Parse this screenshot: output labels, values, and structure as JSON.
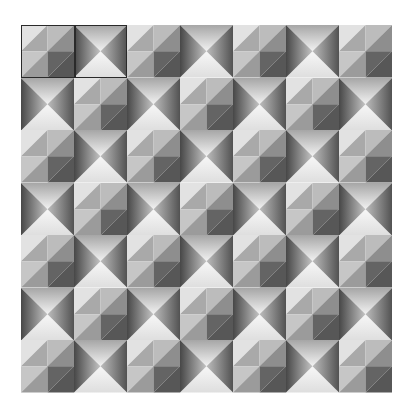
{
  "canvas": {
    "width": 411,
    "height": 412,
    "background": "#ffffff"
  },
  "grid": {
    "rows": 7,
    "cols": 7,
    "origin": [
      21,
      25
    ],
    "tile_size": [
      53,
      52.6
    ],
    "pattern": "checkerboard",
    "layout": [
      [
        "pyramid",
        "x",
        "pyramid",
        "x",
        "pyramid",
        "x",
        "pyramid"
      ],
      [
        "x",
        "pyramid",
        "x",
        "pyramid",
        "x",
        "pyramid",
        "x"
      ],
      [
        "pyramid",
        "x",
        "pyramid",
        "x",
        "pyramid",
        "x",
        "pyramid"
      ],
      [
        "x",
        "pyramid",
        "x",
        "pyramid",
        "x",
        "pyramid",
        "x"
      ],
      [
        "pyramid",
        "x",
        "pyramid",
        "x",
        "pyramid",
        "x",
        "pyramid"
      ],
      [
        "x",
        "pyramid",
        "x",
        "pyramid",
        "x",
        "pyramid",
        "x"
      ],
      [
        "pyramid",
        "x",
        "pyramid",
        "x",
        "pyramid",
        "x",
        "pyramid"
      ]
    ]
  },
  "tiles": {
    "pyramid": {
      "description": "four quadrants each split diagonally",
      "colors": {
        "tl_a": "#e2e2e2",
        "tl_b": "#a9a9a9",
        "tr_a": "#bcbcbc",
        "tr_b": "#8e8e8e",
        "bl_a": "#c6c6c6",
        "bl_b": "#9b9b9b",
        "br_a": "#646464",
        "br_b": "#575757"
      }
    },
    "x": {
      "description": "four triangles meeting at centre with gradients",
      "colors": {
        "top_edge": "#a6a6a6",
        "top_center": "#f2f2f2",
        "bottom_edge": "#dedede",
        "bottom_center": "#f7f7f7",
        "left_edge": "#474747",
        "left_center": "#c4c4c4",
        "right_edge": "#525252",
        "right_center": "#bdbdbd"
      }
    }
  },
  "selection": {
    "row": 0,
    "col_start": 0,
    "col_end": 1,
    "border_color": "#2a2a2a"
  }
}
